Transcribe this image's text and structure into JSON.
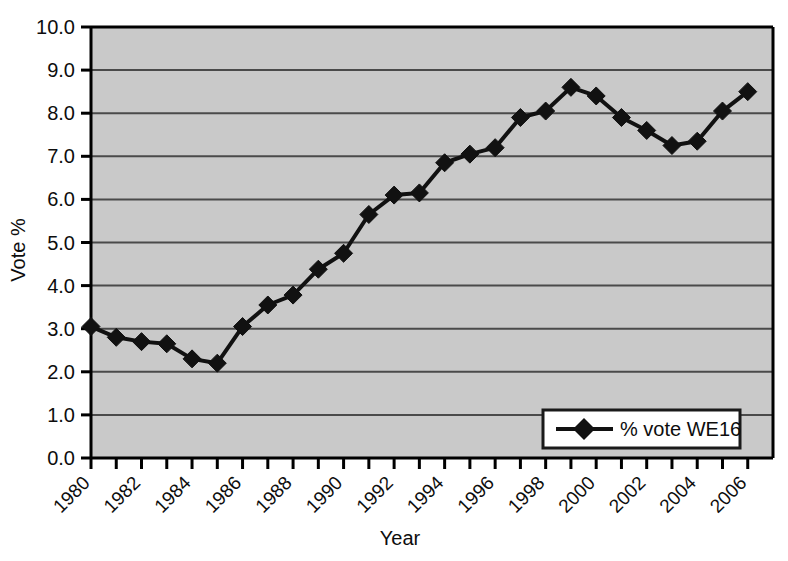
{
  "chart_data": {
    "type": "line",
    "title": "",
    "xlabel": "Year",
    "ylabel": "Vote %",
    "xlim": [
      1980,
      2007
    ],
    "ylim": [
      0.0,
      10.0
    ],
    "grid": true,
    "legend_position": "bottom-right",
    "x_tick_labels": [
      "1980",
      "1982",
      "1984",
      "1986",
      "1988",
      "1990",
      "1992",
      "1994",
      "1996",
      "1998",
      "2000",
      "2002",
      "2004",
      "2006"
    ],
    "y_tick_labels": [
      "0.0",
      "1.0",
      "2.0",
      "3.0",
      "4.0",
      "5.0",
      "6.0",
      "7.0",
      "8.0",
      "9.0",
      "10.0"
    ],
    "y_ticks": [
      0,
      1,
      2,
      3,
      4,
      5,
      6,
      7,
      8,
      9,
      10
    ],
    "x": [
      1980,
      1981,
      1982,
      1983,
      1984,
      1985,
      1986,
      1987,
      1988,
      1989,
      1990,
      1991,
      1992,
      1993,
      1994,
      1995,
      1996,
      1997,
      1998,
      1999,
      2000,
      2001,
      2002,
      2003,
      2004,
      2005,
      2006
    ],
    "series": [
      {
        "name": "% vote WE16",
        "marker": "diamond",
        "color": "#111111",
        "values": [
          3.05,
          2.8,
          2.7,
          2.65,
          2.3,
          2.2,
          3.05,
          3.55,
          3.78,
          4.38,
          4.75,
          5.65,
          6.1,
          6.15,
          6.85,
          7.05,
          7.2,
          7.9,
          8.05,
          8.6,
          8.4,
          7.9,
          7.6,
          7.25,
          7.35,
          8.05,
          8.5
        ]
      }
    ]
  },
  "legend": {
    "entries": [
      {
        "label": "% vote WE16"
      }
    ]
  },
  "axes": {
    "y_title": "Vote %",
    "x_title": "Year"
  },
  "colors": {
    "plot_background": "#c9c9c9",
    "series": "#111111",
    "grid": "#4a4a4a",
    "axis": "#000000",
    "legend_background": "#ffffff"
  }
}
